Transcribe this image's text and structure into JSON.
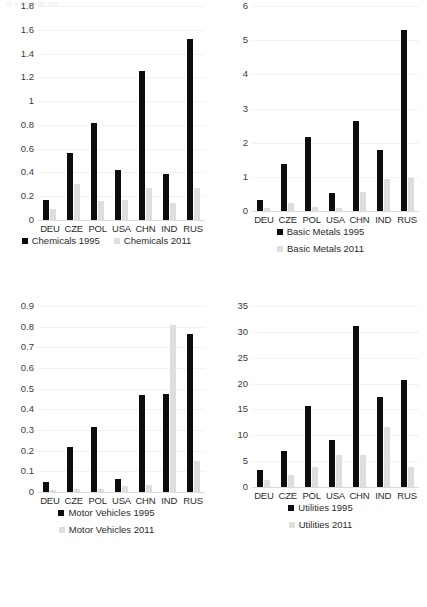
{
  "clipped_header": "of a broader set",
  "palette": {
    "series_1995": "#0d0d0d",
    "series_2011": "#dedede",
    "gridline": "#f2f2f4",
    "axis_text": "#3c3c3c",
    "background": "#ffffff"
  },
  "categories": [
    "DEU",
    "CZE",
    "POL",
    "USA",
    "CHN",
    "IND",
    "RUS"
  ],
  "chart_data": [
    {
      "type": "bar",
      "panel": "top-left",
      "title": "",
      "xlabel": "",
      "ylabel": "",
      "categories": [
        "DEU",
        "CZE",
        "POL",
        "USA",
        "CHN",
        "IND",
        "RUS"
      ],
      "series": [
        {
          "name": "Chemicals 1995",
          "color": "#0d0d0d",
          "values": [
            0.17,
            0.56,
            0.82,
            0.42,
            1.25,
            0.39,
            1.52
          ]
        },
        {
          "name": "Chemicals 2011",
          "color": "#dedede",
          "values": [
            0.09,
            0.3,
            0.16,
            0.17,
            0.27,
            0.14,
            0.27
          ]
        }
      ],
      "ylim": [
        0,
        1.8
      ],
      "yticks": [
        0,
        0.2,
        0.4,
        0.6,
        0.8,
        1,
        1.2,
        1.4,
        1.6,
        1.8
      ],
      "ytick_labels": [
        "0",
        "0.2",
        "0.4",
        "0.6",
        "0.8",
        "1",
        "1.2",
        "1.4",
        "1.6",
        "1.8"
      ],
      "grid": true,
      "legend_position": "bottom",
      "legend_layout": "inline"
    },
    {
      "type": "bar",
      "panel": "top-right",
      "title": "",
      "xlabel": "",
      "ylabel": "",
      "categories": [
        "DEU",
        "CZE",
        "POL",
        "USA",
        "CHN",
        "IND",
        "RUS"
      ],
      "series": [
        {
          "name": "Basic Metals 1995",
          "color": "#0d0d0d",
          "values": [
            0.33,
            1.37,
            2.16,
            0.53,
            2.62,
            1.78,
            5.31
          ]
        },
        {
          "name": "Basic Metals 2011",
          "color": "#dedede",
          "values": [
            0.08,
            0.22,
            0.13,
            0.1,
            0.57,
            0.93,
            0.96
          ]
        }
      ],
      "ylim": [
        0,
        6
      ],
      "yticks": [
        0,
        1,
        2,
        3,
        4,
        5,
        6
      ],
      "ytick_labels": [
        "0",
        "1",
        "2",
        "3",
        "4",
        "5",
        "6"
      ],
      "grid": true,
      "legend_position": "bottom",
      "legend_layout": "stacked"
    },
    {
      "type": "bar",
      "panel": "bottom-left",
      "title": "",
      "xlabel": "",
      "ylabel": "",
      "categories": [
        "DEU",
        "CZE",
        "POL",
        "USA",
        "CHN",
        "IND",
        "RUS"
      ],
      "series": [
        {
          "name": "Motor Vehicles 1995",
          "color": "#0d0d0d",
          "values": [
            0.05,
            0.22,
            0.315,
            0.065,
            0.47,
            0.475,
            0.765
          ]
        },
        {
          "name": "Motor Vehicles 2011",
          "color": "#dedede",
          "values": [
            0.008,
            0.015,
            0.015,
            0.03,
            0.035,
            0.81,
            0.15
          ]
        }
      ],
      "ylim": [
        0,
        0.9
      ],
      "yticks": [
        0,
        0.1,
        0.2,
        0.3,
        0.4,
        0.5,
        0.6,
        0.7,
        0.8,
        0.9
      ],
      "ytick_labels": [
        "0",
        "0.1",
        "0.2",
        "0.3",
        "0.4",
        "0.5",
        "0.6",
        "0.7",
        "0.8",
        "0.9"
      ],
      "grid": true,
      "legend_position": "bottom",
      "legend_layout": "stacked"
    },
    {
      "type": "bar",
      "panel": "bottom-right",
      "title": "",
      "xlabel": "",
      "ylabel": "",
      "categories": [
        "DEU",
        "CZE",
        "POL",
        "USA",
        "CHN",
        "IND",
        "RUS"
      ],
      "series": [
        {
          "name": "Utilities 1995",
          "color": "#0d0d0d",
          "values": [
            3.3,
            7.0,
            15.7,
            9.0,
            31.2,
            17.5,
            20.6
          ]
        },
        {
          "name": "Utilities 2011",
          "color": "#dedede",
          "values": [
            1.4,
            2.3,
            3.9,
            6.2,
            6.2,
            11.7,
            3.9
          ]
        }
      ],
      "ylim": [
        0,
        35
      ],
      "yticks": [
        0,
        5,
        10,
        15,
        20,
        25,
        30,
        35
      ],
      "ytick_labels": [
        "0",
        "5",
        "10",
        "15",
        "20",
        "25",
        "30",
        "35"
      ],
      "grid": true,
      "legend_position": "bottom",
      "legend_layout": "stacked"
    }
  ]
}
